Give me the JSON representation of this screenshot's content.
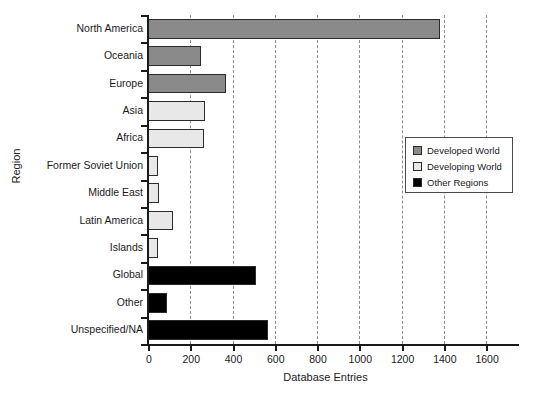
{
  "chart_data": {
    "type": "bar",
    "orientation": "horizontal",
    "title": "",
    "xlabel": "Database Entries",
    "ylabel": "Region",
    "xlim": [
      0,
      1680
    ],
    "xticks": [
      0,
      200,
      400,
      600,
      800,
      1000,
      1200,
      1400,
      1600
    ],
    "xtick_labels": [
      "0",
      "200",
      "400",
      "600",
      "800",
      "1000",
      "1200",
      "1400",
      "1600"
    ],
    "grid": "vertical-dashed",
    "categories": [
      "North America",
      "Oceania",
      "Europe",
      "Asia",
      "Africa",
      "Former Soviet Union",
      "Middle East",
      "Latin America",
      "Islands",
      "Global",
      "Other",
      "Unspecified/NA"
    ],
    "values": [
      1380,
      250,
      370,
      270,
      265,
      45,
      50,
      120,
      45,
      510,
      90,
      570
    ],
    "groups": [
      "Developed World",
      "Developed World",
      "Developed World",
      "Developing World",
      "Developing World",
      "Developing World",
      "Developing World",
      "Developing World",
      "Developing World",
      "Other Regions",
      "Other Regions",
      "Other Regions"
    ],
    "legend": {
      "position": "center-right",
      "entries": [
        {
          "label": "Developed World",
          "color": "#8a8a8a"
        },
        {
          "label": "Developing World",
          "color": "#e8e8e8"
        },
        {
          "label": "Other Regions",
          "color": "#000000"
        }
      ]
    },
    "colors": {
      "developed": "#8a8a8a",
      "developing": "#e8e8e8",
      "other": "#000000",
      "bar_edge": "#2b2b2b",
      "axis": "#1a1a1a",
      "grid": "#8c8c8c",
      "background": "#ffffff"
    }
  }
}
